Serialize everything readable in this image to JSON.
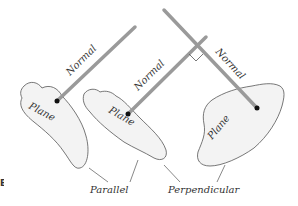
{
  "diagram": {
    "figure_label": "B",
    "planes": [
      {
        "id": "plane-1",
        "label": "Plane"
      },
      {
        "id": "plane-2",
        "label": "Plane"
      },
      {
        "id": "plane-3",
        "label": "Plane"
      }
    ],
    "normals": [
      {
        "id": "normal-1",
        "label": "Normal"
      },
      {
        "id": "normal-2",
        "label": "Normal"
      },
      {
        "id": "normal-3",
        "label": "Normal"
      }
    ],
    "captions": {
      "parallel": "Parallel",
      "perpendicular": "Perpendicular"
    },
    "colors": {
      "normal_line": "#9a9a9a",
      "plane_outline": "#555555",
      "plane_fill": "#f3f3f3",
      "point": "#111111",
      "text": "#333333"
    }
  }
}
